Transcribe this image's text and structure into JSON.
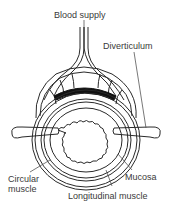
{
  "diagram": {
    "labels": {
      "blood_supply": "Blood supply",
      "diverticulum": "Diverticulum",
      "circular_muscle_line1": "Circular",
      "circular_muscle_line2": "muscle",
      "mucosa": "Mucosa",
      "longitudinal_muscle": "Longitudinal muscle"
    },
    "colors": {
      "line": "#2a2a2a",
      "text": "#3a3a3a",
      "fill_dark": "#111111",
      "background": "#ffffff"
    }
  }
}
